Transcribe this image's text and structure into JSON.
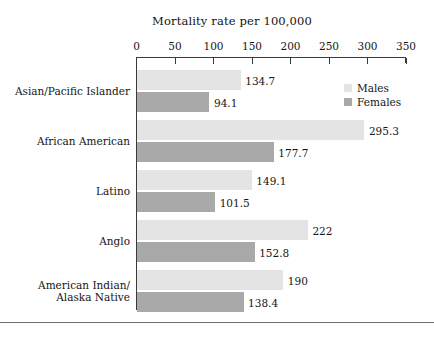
{
  "chart_data": {
    "type": "bar",
    "orientation": "horizontal",
    "title": "Mortality rate per 100,000",
    "xlabel": "",
    "ylabel": "",
    "xlim": [
      0,
      350
    ],
    "xticks": [
      0,
      50,
      100,
      150,
      200,
      250,
      300,
      350
    ],
    "xtick_labels": [
      "0",
      "50",
      "100",
      "150",
      "200",
      "250",
      "300",
      "350"
    ],
    "grid": false,
    "legend_position": "upper right",
    "categories": [
      "Asian/Pacific Islander",
      "African American",
      "Latino",
      "Anglo",
      "American Indian/ Alaska Native"
    ],
    "category_lines": [
      [
        "Asian/Pacific Islander"
      ],
      [
        "African American"
      ],
      [
        "Latino"
      ],
      [
        "Anglo"
      ],
      [
        "American Indian/",
        "Alaska Native"
      ]
    ],
    "series": [
      {
        "name": "Males",
        "color": "#e4e4e4",
        "values": [
          134.7,
          295.3,
          149.1,
          222,
          190
        ],
        "labels": [
          "134.7",
          "295.3",
          "149.1",
          "222",
          "190"
        ]
      },
      {
        "name": "Females",
        "color": "#a9a9a9",
        "values": [
          94.1,
          177.7,
          101.5,
          152.8,
          138.4
        ],
        "labels": [
          "94.1",
          "177.7",
          "101.5",
          "152.8",
          "138.4"
        ]
      }
    ]
  },
  "legend": {
    "items": [
      {
        "label": "Males",
        "color": "#e4e4e4"
      },
      {
        "label": "Females",
        "color": "#a9a9a9"
      }
    ]
  },
  "axis": {
    "tick_labels": [
      "0",
      "50",
      "100",
      "150",
      "200",
      "250",
      "300",
      "350"
    ]
  }
}
